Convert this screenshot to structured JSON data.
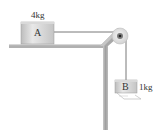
{
  "diagram": {
    "type": "physics-pulley-system",
    "block_a": {
      "letter": "A",
      "mass_label": "4kg"
    },
    "block_b": {
      "letter": "B",
      "mass_label": "1kg"
    },
    "colors": {
      "table": "#a9a9a9",
      "table_highlight": "#d0d0d0",
      "block_face": "#c8c8c8",
      "block_light": "#e6e6e6",
      "string": "#555555",
      "pulley": "#e8e8e8",
      "pulley_hub": "#444444",
      "text": "#333333"
    }
  }
}
